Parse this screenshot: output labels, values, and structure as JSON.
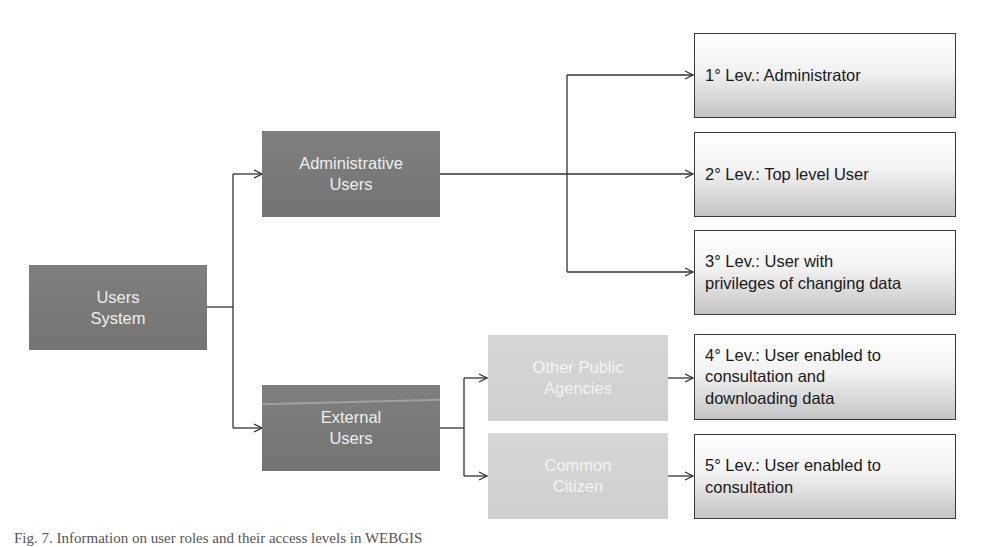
{
  "diagram": {
    "root": {
      "label_line1": "Users",
      "label_line2": "System",
      "color": "#7a7a7a"
    },
    "groups": {
      "administrative": {
        "label_line1": "Administrative",
        "label_line2": "Users",
        "color": "#787878"
      },
      "external": {
        "label_line1": "External",
        "label_line2": "Users",
        "color": "#787878"
      }
    },
    "external_subgroups": {
      "other_public_agencies": {
        "label_line1": "Other Public",
        "label_line2": "Agencies",
        "color": "#d3d3d3"
      },
      "common_citizen": {
        "label_line1": "Common",
        "label_line2": "Citizen",
        "color": "#d3d3d3"
      }
    },
    "levels": [
      {
        "lines": [
          "1° Lev.: Administrator"
        ]
      },
      {
        "lines": [
          "2° Lev.: Top level User"
        ]
      },
      {
        "lines": [
          "3° Lev.: User with",
          "privileges of changing data"
        ]
      },
      {
        "lines": [
          "4° Lev.: User enabled to",
          "consultation and",
          "downloading data"
        ]
      },
      {
        "lines": [
          "5° Lev.: User enabled to",
          "consultation"
        ]
      }
    ],
    "edges": [
      [
        "Users System",
        "Administrative Users"
      ],
      [
        "Users System",
        "External Users"
      ],
      [
        "Administrative Users",
        "1° Lev.: Administrator"
      ],
      [
        "Administrative Users",
        "2° Lev.: Top level User"
      ],
      [
        "Administrative Users",
        "3° Lev.: User with privileges of changing data"
      ],
      [
        "External Users",
        "Other Public Agencies"
      ],
      [
        "External Users",
        "Common Citizen"
      ],
      [
        "Other Public Agencies",
        "4° Lev.: User enabled to consultation and downloading data"
      ],
      [
        "Common Citizen",
        "5° Lev.: User enabled to consultation"
      ]
    ]
  },
  "caption": {
    "text": "Fig. 7. Information on user roles and their access levels in WEBGIS"
  }
}
